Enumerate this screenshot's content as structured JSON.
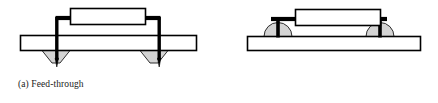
{
  "figure": {
    "background_color": "#ffffff",
    "line_color": "#000000",
    "solder_fill_color": "#d4d4d4",
    "body_fill_color": "#ffffff",
    "board_fill_color": "#ffffff",
    "panels": [
      {
        "id": "feed-through",
        "caption": "(a) Feed-through",
        "component_label": "component-body",
        "board_label": "circuit-board",
        "lead_label": "component-lead",
        "solder_label": "solder-fillet"
      },
      {
        "id": "surface-mount",
        "caption": "(b) Surface mount",
        "component_label": "component-body",
        "board_label": "circuit-board",
        "lead_label": "component-lead",
        "solder_label": "solder-joint"
      }
    ]
  },
  "captions": {
    "feed_through": "(a) Feed-through",
    "surface_mount": "(b) Surface mount"
  }
}
